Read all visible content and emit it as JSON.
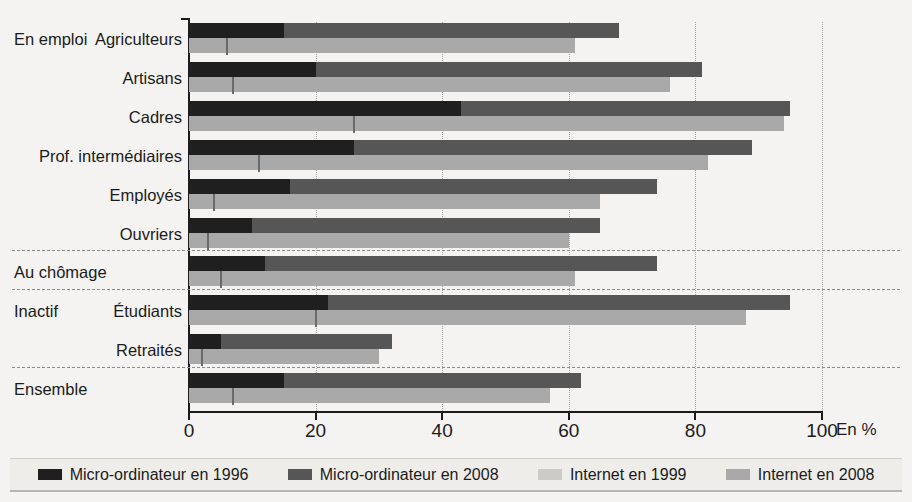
{
  "chart_data": {
    "type": "bar",
    "orientation": "horizontal",
    "title": "",
    "xlabel": "En %",
    "ylabel": "",
    "xlim": [
      0,
      100
    ],
    "xticks": [
      0,
      20,
      40,
      60,
      80,
      100
    ],
    "grid": "vertical dotted gridlines at each tick",
    "legend_position": "bottom",
    "series": [
      {
        "name": "Micro-ordinateur en 1996",
        "color": "#1f1f1f"
      },
      {
        "name": "Micro-ordinateur en 2008",
        "color": "#565656"
      },
      {
        "name": "Internet en 1999",
        "color": "#d5d4d1"
      },
      {
        "name": "Internet en 2008",
        "color": "#a9a9a9"
      }
    ],
    "categories": [
      "Agriculteurs",
      "Artisans",
      "Cadres",
      "Prof. intermédiaires",
      "Employés",
      "Ouvriers",
      "Au chômage",
      "Étudiants",
      "Retraités",
      "Ensemble"
    ],
    "values": {
      "micro_1996": [
        15,
        20,
        43,
        26,
        16,
        10,
        12,
        22,
        5,
        15
      ],
      "micro_2008": [
        68,
        81,
        95,
        89,
        74,
        65,
        74,
        95,
        32,
        62
      ],
      "internet_1999": [
        6,
        7,
        26,
        11,
        4,
        3,
        5,
        20,
        2,
        7
      ],
      "internet_2008": [
        61,
        76,
        94,
        82,
        65,
        60,
        61,
        88,
        30,
        57
      ]
    }
  },
  "axis": {
    "ticks": [
      {
        "label": "0",
        "value": 0
      },
      {
        "label": "20",
        "value": 20
      },
      {
        "label": "40",
        "value": 40
      },
      {
        "label": "60",
        "value": 60
      },
      {
        "label": "80",
        "value": 80
      },
      {
        "label": "100",
        "value": 100
      }
    ],
    "unit_label": "En %"
  },
  "rows": [
    {
      "group": "En emploi",
      "label": "Agriculteurs",
      "micro_1996": 15,
      "micro_2008": 68,
      "internet_1999": 6,
      "internet_2008": 61
    },
    {
      "group": "",
      "label": "Artisans",
      "micro_1996": 20,
      "micro_2008": 81,
      "internet_1999": 7,
      "internet_2008": 76
    },
    {
      "group": "",
      "label": "Cadres",
      "micro_1996": 43,
      "micro_2008": 95,
      "internet_1999": 26,
      "internet_2008": 94
    },
    {
      "group": "",
      "label": "Prof. intermédiaires",
      "micro_1996": 26,
      "micro_2008": 89,
      "internet_1999": 11,
      "internet_2008": 82
    },
    {
      "group": "",
      "label": "Employés",
      "micro_1996": 16,
      "micro_2008": 74,
      "internet_1999": 4,
      "internet_2008": 65
    },
    {
      "group": "",
      "label": "Ouvriers",
      "micro_1996": 10,
      "micro_2008": 65,
      "internet_1999": 3,
      "internet_2008": 60
    },
    {
      "group": "Au chômage",
      "label": "",
      "micro_1996": 12,
      "micro_2008": 74,
      "internet_1999": 5,
      "internet_2008": 61
    },
    {
      "group": "Inactif",
      "label": "Étudiants",
      "micro_1996": 22,
      "micro_2008": 95,
      "internet_1999": 20,
      "internet_2008": 88
    },
    {
      "group": "",
      "label": "Retraités",
      "micro_1996": 5,
      "micro_2008": 32,
      "internet_1999": 2,
      "internet_2008": 30
    },
    {
      "group": "Ensemble",
      "label": "",
      "micro_1996": 15,
      "micro_2008": 62,
      "internet_1999": 7,
      "internet_2008": 57
    }
  ],
  "legend": {
    "items": [
      {
        "label": "Micro-ordinateur en 1996",
        "color": "#1f1f1f"
      },
      {
        "label": "Micro-ordinateur en 2008",
        "color": "#565656"
      },
      {
        "label": "Internet en 1999",
        "color": "#cdcbc8"
      },
      {
        "label": "Internet en 2008",
        "color": "#a9a9a9"
      }
    ]
  },
  "colors": {
    "micro_1996": "#1f1f1f",
    "micro_2008": "#565656",
    "internet_1999": "#cdcbc8",
    "internet_2008": "#a9a9a9",
    "axis": "#1b1b1b",
    "background": "#f4f3f1"
  }
}
